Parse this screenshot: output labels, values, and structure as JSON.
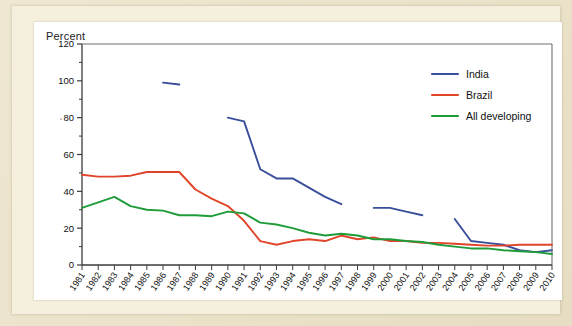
{
  "axis_label_top": "Percent",
  "legend": {
    "items": [
      {
        "label": "India",
        "color": "#3a4f9b"
      },
      {
        "label": "Brazil",
        "color": "#e0452a"
      },
      {
        "label": "All developing",
        "color": "#1f9c3a"
      }
    ]
  },
  "y_ticks": [
    "0",
    "20",
    "40",
    "60",
    "80",
    "100",
    "120"
  ],
  "chart_data": {
    "type": "line",
    "title": "",
    "xlabel": "",
    "ylabel": "Percent",
    "ylim": [
      0,
      120
    ],
    "ytick_step": 20,
    "yminor_step": 10,
    "grid": false,
    "legend_position": "top-right",
    "x": [
      "1981",
      "1982",
      "1983",
      "1984",
      "1985",
      "1986",
      "1987",
      "1988",
      "1989",
      "1990",
      "1991",
      "1992",
      "1993",
      "1994",
      "1995",
      "1996",
      "1997",
      "1998",
      "1999",
      "2000",
      "2001",
      "2002",
      "2003",
      "2004",
      "2005",
      "2006",
      "2007",
      "2008",
      "2009",
      "2010"
    ],
    "series": [
      {
        "name": "India",
        "color": "#3a4f9b",
        "note": "series has gaps (missing years)",
        "values": [
          null,
          null,
          null,
          null,
          null,
          99,
          98,
          null,
          null,
          80,
          78,
          52,
          47,
          47,
          42,
          37,
          33,
          null,
          31,
          31,
          29,
          27,
          null,
          25,
          13,
          12,
          11,
          8,
          7,
          8
        ]
      },
      {
        "name": "Brazil",
        "color": "#e0452a",
        "values": [
          49,
          48,
          48,
          48.5,
          50.5,
          50.5,
          50.5,
          41,
          36,
          32,
          24,
          13,
          11,
          13,
          14,
          13,
          16,
          14,
          15,
          13,
          13,
          12,
          12,
          11.5,
          11,
          10.5,
          10.5,
          11,
          11,
          11
        ]
      },
      {
        "name": "All developing",
        "color": "#1f9c3a",
        "values": [
          31,
          34,
          37,
          32,
          30,
          29.5,
          27,
          27,
          26.5,
          29,
          28,
          23,
          22,
          20,
          17.5,
          16,
          17,
          16,
          14,
          14,
          13,
          12.5,
          11,
          10,
          9,
          9,
          8,
          7.5,
          7,
          6
        ]
      }
    ]
  }
}
